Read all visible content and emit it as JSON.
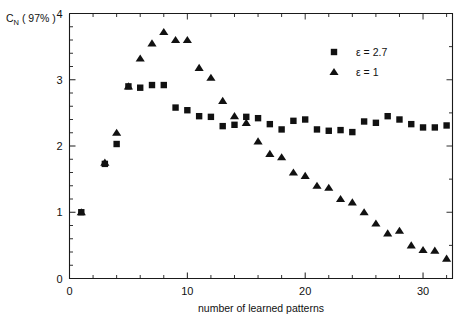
{
  "chart_data": {
    "type": "scatter",
    "title": "",
    "xlabel": "number of learned patterns",
    "ylabel": "C_N ( 97% )",
    "ylabel_main": "C",
    "ylabel_sub": "N",
    "ylabel_paren": "( 97% )",
    "xlim": [
      0,
      32.5
    ],
    "ylim": [
      0,
      4
    ],
    "xticks": [
      0,
      10,
      20,
      30
    ],
    "xticklabels": [
      "0",
      "10",
      "20",
      "30"
    ],
    "xminor_step": 2,
    "yticks": [
      0,
      1,
      2,
      3,
      4
    ],
    "yticklabels": [
      "0",
      "1",
      "2",
      "3",
      "4"
    ],
    "yminor_step": 0.2,
    "grid": false,
    "legend_position": "upper right",
    "marker_color": "#111111",
    "series": [
      {
        "name": "ε = 2.7",
        "marker": "square",
        "x": [
          1,
          3,
          4,
          5,
          6,
          7,
          8,
          9,
          10,
          11,
          12,
          13,
          14,
          15,
          16,
          17,
          18,
          19,
          20,
          21,
          22,
          23,
          24,
          25,
          26,
          27,
          28,
          29,
          30,
          31,
          32
        ],
        "values": [
          1.0,
          1.73,
          2.03,
          2.9,
          2.88,
          2.92,
          2.92,
          2.58,
          2.54,
          2.45,
          2.44,
          2.3,
          2.32,
          2.44,
          2.42,
          2.33,
          2.25,
          2.38,
          2.4,
          2.25,
          2.23,
          2.24,
          2.21,
          2.37,
          2.35,
          2.45,
          2.4,
          2.33,
          2.28,
          2.28,
          2.31
        ]
      },
      {
        "name": "ε = 1",
        "marker": "triangle",
        "x": [
          1,
          3,
          4,
          5,
          6,
          7,
          8,
          9,
          10,
          11,
          12,
          13,
          14,
          15,
          16,
          17,
          18,
          19,
          20,
          21,
          22,
          23,
          24,
          25,
          26,
          27,
          28,
          29,
          30,
          31,
          32
        ],
        "values": [
          1.0,
          1.75,
          2.2,
          2.9,
          3.32,
          3.55,
          3.72,
          3.6,
          3.6,
          3.18,
          3.03,
          2.68,
          2.45,
          2.35,
          2.07,
          1.88,
          1.83,
          1.6,
          1.55,
          1.4,
          1.37,
          1.2,
          1.15,
          1.0,
          0.83,
          0.68,
          0.72,
          0.5,
          0.43,
          0.42,
          0.3
        ]
      }
    ],
    "legend_entries": [
      {
        "label": "ε = 2.7",
        "marker": "square"
      },
      {
        "label": "ε = 1",
        "marker": "triangle"
      }
    ]
  }
}
